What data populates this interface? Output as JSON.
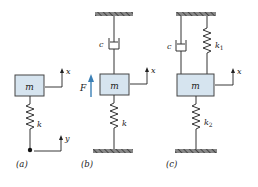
{
  "colors": {
    "mass_fill": "#d6e4ef",
    "stroke": "#333333",
    "force_arrow": "#3a7fb5",
    "ground_fill": "#666666"
  },
  "panels": [
    {
      "id": "a",
      "caption": "(a)",
      "mass_label": "m",
      "spring_labels": [
        "k"
      ],
      "coord_labels": [
        "x",
        "y"
      ]
    },
    {
      "id": "b",
      "caption": "(b)",
      "mass_label": "m",
      "spring_labels": [
        "k"
      ],
      "damper_label": "c",
      "force_label": "F",
      "coord_labels": [
        "x"
      ]
    },
    {
      "id": "c",
      "caption": "(c)",
      "mass_label": "m",
      "spring_labels": [
        "k",
        "k"
      ],
      "spring_subscripts": [
        "1",
        "2"
      ],
      "damper_label": "c",
      "coord_labels": [
        "x"
      ]
    }
  ]
}
